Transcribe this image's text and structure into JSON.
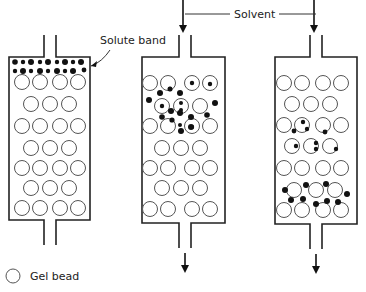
{
  "diagram": {
    "labels": {
      "solute_band": "Solute band",
      "solvent": "Solvent",
      "legend_gel_bead": "Gel bead"
    },
    "colors": {
      "ink": "#111111",
      "bead_stroke": "#555555",
      "background": "#ffffff"
    },
    "bead_radius": 7.5,
    "columns": [
      {
        "id": "column-1",
        "box": {
          "x": 9,
          "y": 57,
          "w": 81,
          "h": 163
        },
        "inlet_x": 50,
        "has_solvent_arrow": false,
        "has_outlet_arrow": false,
        "bead_rows": [
          {
            "y": 82,
            "xs": [
              22,
              40,
              60,
              78
            ]
          },
          {
            "y": 104,
            "xs": [
              31,
              50,
              69
            ]
          },
          {
            "y": 126,
            "xs": [
              22,
              40,
              60,
              78
            ]
          },
          {
            "y": 148,
            "xs": [
              31,
              50,
              69
            ]
          },
          {
            "y": 168,
            "xs": [
              22,
              40,
              60,
              78
            ]
          },
          {
            "y": 188,
            "xs": [
              31,
              50,
              69
            ]
          },
          {
            "y": 208,
            "xs": [
              22,
              40,
              60,
              78
            ]
          }
        ],
        "solutes": [
          [
            15,
            62,
            2.8
          ],
          [
            23,
            62,
            2.2
          ],
          [
            31,
            62,
            3
          ],
          [
            40,
            62,
            2.2
          ],
          [
            48,
            62,
            3
          ],
          [
            57,
            62,
            2.2
          ],
          [
            65,
            62,
            3
          ],
          [
            73,
            62,
            2.2
          ],
          [
            81,
            62,
            3
          ],
          [
            15,
            71,
            2.2
          ],
          [
            23,
            71,
            3
          ],
          [
            31,
            71,
            2.2
          ],
          [
            40,
            71,
            3
          ],
          [
            48,
            71,
            2.2
          ],
          [
            57,
            71,
            3
          ],
          [
            65,
            71,
            2.2
          ],
          [
            73,
            71,
            3
          ],
          [
            84,
            70,
            2.4
          ]
        ],
        "trapped": []
      },
      {
        "id": "column-2",
        "box": {
          "x": 142,
          "y": 57,
          "w": 83,
          "h": 166
        },
        "inlet_x": 185,
        "has_solvent_arrow": true,
        "has_outlet_arrow": true,
        "bead_rows": [
          {
            "y": 83,
            "xs": [
              150,
              168,
              192,
              210
            ]
          },
          {
            "y": 106,
            "xs": [
              162,
              181,
              200
            ]
          },
          {
            "y": 126,
            "xs": [
              150,
              168,
              192,
              210
            ]
          },
          {
            "y": 148,
            "xs": [
              162,
              181,
              200
            ]
          },
          {
            "y": 168,
            "xs": [
              150,
              168,
              192,
              210
            ]
          },
          {
            "y": 188,
            "xs": [
              162,
              181,
              200
            ]
          },
          {
            "y": 209,
            "xs": [
              150,
              168,
              192,
              210
            ]
          }
        ],
        "solutes": [
          [
            160,
            93,
            3
          ],
          [
            170,
            89,
            2.5
          ],
          [
            180,
            93,
            3
          ],
          [
            149,
            100,
            3
          ],
          [
            215,
            103,
            3
          ],
          [
            171,
            111,
            3
          ],
          [
            180,
            113,
            3
          ],
          [
            191,
            117,
            3
          ],
          [
            207,
            115,
            2.8
          ],
          [
            162,
            117,
            2.8
          ],
          [
            191,
            127,
            3
          ],
          [
            181,
            131,
            3
          ],
          [
            180,
            125,
            2
          ],
          [
            172,
            120,
            2.6
          ]
        ],
        "trapped": [
          [
            170,
            89,
            2.2
          ],
          [
            192,
            83,
            2.2
          ],
          [
            210,
            84,
            2.2
          ],
          [
            162,
            106,
            2.2
          ],
          [
            181,
            103,
            2
          ],
          [
            181,
            110,
            2
          ],
          [
            192,
            127,
            2.2
          ]
        ]
      },
      {
        "id": "column-3",
        "box": {
          "x": 275,
          "y": 57,
          "w": 82,
          "h": 167
        },
        "inlet_x": 316,
        "has_solvent_arrow": true,
        "has_outlet_arrow": true,
        "bead_rows": [
          {
            "y": 83,
            "xs": [
              284,
              302,
              323,
              341
            ]
          },
          {
            "y": 104,
            "xs": [
              292,
              311,
              330
            ]
          },
          {
            "y": 125,
            "xs": [
              284,
              302,
              323,
              341
            ]
          },
          {
            "y": 146,
            "xs": [
              292,
              311,
              330
            ]
          },
          {
            "y": 168,
            "xs": [
              284,
              302,
              323,
              341
            ]
          },
          {
            "y": 190,
            "xs": [
              294,
              316,
              335
            ]
          },
          {
            "y": 210,
            "xs": [
              284,
              302,
              323,
              341
            ]
          }
        ],
        "solutes": [
          [
            294,
            131,
            2.4
          ],
          [
            325,
            132,
            2.4
          ],
          [
            285,
            190,
            3
          ],
          [
            306,
            185,
            3
          ],
          [
            326,
            184,
            3
          ],
          [
            347,
            194,
            3
          ],
          [
            291,
            200,
            3
          ],
          [
            303,
            199,
            3
          ],
          [
            316,
            204,
            3
          ],
          [
            327,
            201,
            3
          ],
          [
            338,
            202,
            3
          ]
        ],
        "trapped": [
          [
            303,
            122,
            2.2
          ],
          [
            307,
            129,
            2.2
          ],
          [
            296,
            146,
            2.2
          ],
          [
            316,
            143,
            2.2
          ],
          [
            316,
            149,
            2.2
          ],
          [
            336,
            149,
            2.2
          ]
        ]
      }
    ],
    "legend": {
      "bead": {
        "x": 13,
        "y": 276
      },
      "text": {
        "x": 30,
        "y": 280
      }
    }
  }
}
